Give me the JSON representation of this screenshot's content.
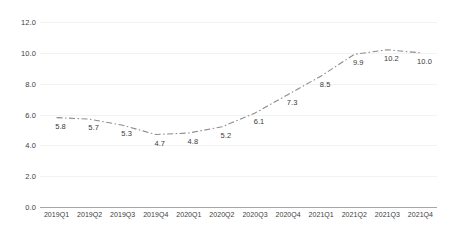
{
  "chart_data": {
    "type": "line",
    "title": "",
    "subtitle": "",
    "xlabel": "",
    "ylabel": "",
    "categories": [
      "2019Q1",
      "2019Q2",
      "2019Q3",
      "2019Q4",
      "2020Q1",
      "2020Q2",
      "2020Q3",
      "2020Q4",
      "2021Q1",
      "2021Q2",
      "2021Q3",
      "2021Q4"
    ],
    "values": [
      5.8,
      5.7,
      5.3,
      4.7,
      4.8,
      5.2,
      6.1,
      7.3,
      8.5,
      9.9,
      10.2,
      10.0
    ],
    "data_labels": [
      "5.8",
      "5.7",
      "5.3",
      "4.7",
      "4.8",
      "5.2",
      "6.1",
      "7.3",
      "8.5",
      "9.9",
      "10.2",
      "10.0"
    ],
    "ylim": [
      0.0,
      12.0
    ],
    "yticks": [
      0.0,
      2.0,
      4.0,
      6.0,
      8.0,
      10.0,
      12.0
    ],
    "ytick_labels": [
      "0.0",
      "2.0",
      "4.0",
      "6.0",
      "8.0",
      "10.0",
      "12.0"
    ],
    "grid": true,
    "legend": false,
    "series": [
      {
        "name": "",
        "values": [
          5.8,
          5.7,
          5.3,
          4.7,
          4.8,
          5.2,
          6.1,
          7.3,
          8.5,
          9.9,
          10.2,
          10.0
        ],
        "line_style": "dash-dot",
        "color": "#8c8c8c",
        "markers": false
      }
    ]
  },
  "style": {
    "line_color": "#8c8c8c",
    "grid_color": "#f2f2f2",
    "axis_color": "#a6a6a6",
    "text_color": "#404040",
    "background": "#ffffff"
  }
}
